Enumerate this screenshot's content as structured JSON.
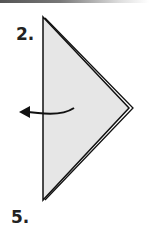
{
  "diagram": {
    "steps": [
      {
        "label": "2."
      },
      {
        "label": "5."
      }
    ],
    "figure": {
      "shape": "triangle-fold",
      "fill_color": "#e6e6e6",
      "stroke_color": "#111111",
      "arrow_icon": "curved-arrow-left"
    }
  }
}
